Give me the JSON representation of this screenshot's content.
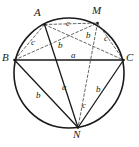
{
  "figure": {
    "type": "geometry-diagram",
    "width": 139,
    "height": 147,
    "background_color": "#ffffff",
    "stroke_color": "#1a1a1a",
    "dashed_stroke_color": "#555555",
    "circle": {
      "cx": 69,
      "cy": 73,
      "r": 55,
      "stroke_width": 1.6,
      "style": "solid"
    },
    "vertices": [
      {
        "id": "A",
        "label": "A",
        "x": 44.5,
        "y": 24.5,
        "label_x": 34,
        "label_y": 7
      },
      {
        "id": "M",
        "label": "M",
        "x": 97.5,
        "y": 23.0,
        "label_x": 92,
        "label_y": 5
      },
      {
        "id": "B",
        "label": "B",
        "x": 14.5,
        "y": 60.0,
        "label_x": 2,
        "label_y": 52
      },
      {
        "id": "C",
        "label": "C",
        "x": 123.5,
        "y": 60.0,
        "label_x": 126,
        "label_y": 52
      },
      {
        "id": "N",
        "label": "N",
        "x": 78.0,
        "y": 127.5,
        "label_x": 73,
        "label_y": 129
      }
    ],
    "segments": [
      {
        "id": "BC",
        "from": "B",
        "to": "C",
        "style": "solid",
        "width": 1.3
      },
      {
        "id": "BN",
        "from": "B",
        "to": "N",
        "style": "solid",
        "width": 1.3
      },
      {
        "id": "NC",
        "from": "N",
        "to": "C",
        "style": "solid",
        "width": 1.3
      },
      {
        "id": "AN",
        "from": "A",
        "to": "N",
        "style": "solid",
        "width": 1.3
      },
      {
        "id": "AB",
        "from": "A",
        "to": "B",
        "style": "dashed",
        "width": 0.9
      },
      {
        "id": "AM",
        "from": "A",
        "to": "M",
        "style": "dashed",
        "width": 0.9
      },
      {
        "id": "AC",
        "from": "A",
        "to": "C",
        "style": "dashed",
        "width": 0.9
      },
      {
        "id": "BM",
        "from": "B",
        "to": "M",
        "style": "dashed",
        "width": 0.9
      },
      {
        "id": "MC",
        "from": "M",
        "to": "C",
        "style": "dashed",
        "width": 0.9
      },
      {
        "id": "MN",
        "from": "M",
        "to": "N",
        "style": "dashed",
        "width": 0.9
      }
    ],
    "segment_labels": [
      {
        "id": "label-c-top",
        "text": "c",
        "x": 66,
        "y": 19,
        "for": "AM"
      },
      {
        "id": "label-c-left",
        "text": "c",
        "x": 31,
        "y": 38,
        "for": "AB"
      },
      {
        "id": "label-c-right",
        "text": "c",
        "x": 104,
        "y": 34,
        "for": "MC"
      },
      {
        "id": "label-b-upper-left",
        "text": "b",
        "x": 58,
        "y": 41,
        "for": "AC"
      },
      {
        "id": "label-b-upper-right",
        "text": "b",
        "x": 86,
        "y": 31,
        "for": "BM"
      },
      {
        "id": "label-a-chord",
        "text": "a",
        "x": 71,
        "y": 51,
        "for": "BC"
      },
      {
        "id": "label-a-center",
        "text": "a",
        "x": 62,
        "y": 83,
        "for": "AN"
      },
      {
        "id": "label-b-lower-left",
        "text": "b",
        "x": 36,
        "y": 91,
        "for": "BN"
      },
      {
        "id": "label-b-lower-right",
        "text": "b",
        "x": 96,
        "y": 85,
        "for": "MN"
      },
      {
        "id": "label-c-lower",
        "text": "c",
        "x": 82,
        "y": 101,
        "for": "NC"
      }
    ]
  }
}
